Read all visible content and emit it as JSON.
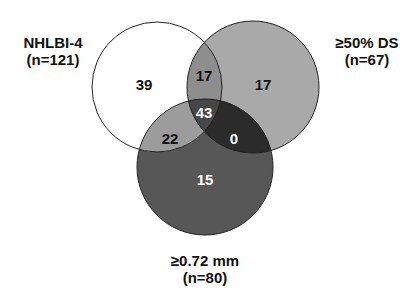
{
  "diagram": {
    "type": "venn-3",
    "sets": [
      {
        "id": "A",
        "label": "NHLBI-4",
        "n": "(n=121)",
        "fill": "#ffffff"
      },
      {
        "id": "B",
        "label": "≥50% DS",
        "n": "(n=67)",
        "fill": "#a9a9a9"
      },
      {
        "id": "C",
        "label": "≥0.72 mm",
        "n": "(n=80)",
        "fill": "#575757"
      }
    ],
    "regions": {
      "A_only": "39",
      "B_only": "17",
      "C_only": "15",
      "AB_only": "17",
      "AC_only": "22",
      "BC_only": "0",
      "ABC": "43"
    },
    "region_colors": {
      "AB": "#8e8e8e",
      "AC": "#9c9c9c",
      "BC": "#2b2b2b",
      "ABC": "#474747"
    }
  }
}
